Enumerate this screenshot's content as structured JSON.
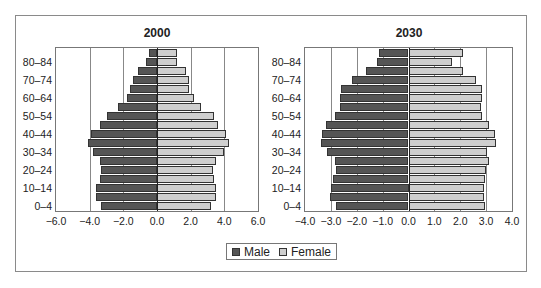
{
  "legend": {
    "male_label": "Male",
    "female_label": "Female",
    "male_color": "#555555",
    "female_color": "#cfcfcf"
  },
  "charts": [
    {
      "title": "2000",
      "xticks": [
        "−6.0",
        "−4.0",
        "−2.0",
        "0.0",
        "2.0",
        "4.0",
        "6.0"
      ],
      "ylabels": [
        "0–4",
        "10–14",
        "20–24",
        "30–34",
        "40–44",
        "50–54",
        "60–64",
        "70–74",
        "80–84"
      ]
    },
    {
      "title": "2030",
      "xticks": [
        "−4.0",
        "−3.0",
        "−2.0",
        "−1.0",
        "0.0",
        "1.0",
        "2.0",
        "3.0",
        "4.0"
      ],
      "ylabels": [
        "0–4",
        "10–14",
        "20–24",
        "30–34",
        "40–44",
        "50–54",
        "60–64",
        "70–74",
        "80–84"
      ]
    }
  ],
  "chart_data": [
    {
      "type": "bar",
      "orientation": "horizontal",
      "subtype": "population-pyramid",
      "title": "2000",
      "xlabel": "",
      "ylabel": "",
      "xlim": [
        -6,
        6
      ],
      "xticks": [
        -6,
        -4,
        -2,
        0,
        2,
        4,
        6
      ],
      "grid": "vertical",
      "legend_position": "bottom",
      "categories": [
        "0–4",
        "5–9",
        "10–14",
        "15–19",
        "20–24",
        "25–29",
        "30–34",
        "35–39",
        "40–44",
        "45–49",
        "50–54",
        "55–59",
        "60–64",
        "65–69",
        "70–74",
        "75–79",
        "80–84",
        "85+"
      ],
      "series": [
        {
          "name": "Male",
          "values": [
            -3.3,
            -3.6,
            -3.6,
            -3.4,
            -3.3,
            -3.4,
            -3.8,
            -4.1,
            -3.9,
            -3.4,
            -3.0,
            -2.3,
            -1.8,
            -1.6,
            -1.4,
            -1.1,
            -0.65,
            -0.5
          ]
        },
        {
          "name": "Female",
          "values": [
            3.2,
            3.5,
            3.5,
            3.4,
            3.3,
            3.5,
            4.0,
            4.3,
            4.1,
            3.6,
            3.4,
            2.6,
            2.2,
            1.9,
            1.9,
            1.7,
            1.2,
            1.2
          ]
        }
      ]
    },
    {
      "type": "bar",
      "orientation": "horizontal",
      "subtype": "population-pyramid",
      "title": "2030",
      "xlabel": "",
      "ylabel": "",
      "xlim": [
        -4,
        4
      ],
      "xticks": [
        -4,
        -3,
        -2,
        -1,
        0,
        1,
        2,
        3,
        4
      ],
      "grid": "vertical",
      "legend_position": "bottom",
      "categories": [
        "0–4",
        "5–9",
        "10–14",
        "15–19",
        "20–24",
        "25–29",
        "30–34",
        "35–39",
        "40–44",
        "45–49",
        "50–54",
        "55–59",
        "60–64",
        "65–69",
        "70–74",
        "75–79",
        "80–84",
        "85+"
      ],
      "series": [
        {
          "name": "Male",
          "values": [
            -2.8,
            -3.05,
            -3.0,
            -2.9,
            -2.8,
            -2.85,
            -3.15,
            -3.4,
            -3.35,
            -3.2,
            -2.85,
            -2.65,
            -2.65,
            -2.6,
            -2.2,
            -1.65,
            -1.2,
            -1.15
          ]
        },
        {
          "name": "Female",
          "values": [
            2.95,
            2.9,
            2.9,
            2.95,
            3.0,
            3.1,
            3.05,
            3.4,
            3.35,
            3.1,
            2.85,
            2.8,
            2.85,
            2.85,
            2.6,
            2.1,
            1.7,
            2.1
          ]
        }
      ]
    }
  ]
}
